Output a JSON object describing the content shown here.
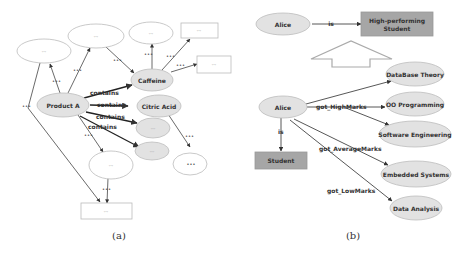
{
  "figure_a": {
    "caption": "(a)",
    "nodes": {
      "product": "Product A",
      "caffeine": "Caffeine",
      "citric": "Citric Acid",
      "grey1": "---",
      "grey2": "---",
      "top_left": "---",
      "top_mid": "---",
      "top_right": "---",
      "box_top": "---",
      "box_right": "---",
      "mid_white": "---",
      "right_small": "•••",
      "box_bottom": "---"
    },
    "edges": {
      "contains1": "contains",
      "contains2": "contains",
      "contains3": "contains",
      "contains4": "contains",
      "dots": "•••"
    }
  },
  "figure_b": {
    "caption": "(b)",
    "nodes": {
      "alice_top": "Alice",
      "high_line1": "High-performing",
      "high_line2": "Student",
      "alice": "Alice",
      "db": "DataBase Theory",
      "oo": "OO Programming",
      "se": "Software Engineering",
      "student": "Student",
      "emb": "Embedded Systems",
      "da": "Data Analysis"
    },
    "edges": {
      "is_top": "is",
      "is": "is",
      "high": "got_HighMarks",
      "avg": "got_AverageMarks",
      "low": "got_LowMarks"
    }
  },
  "colors": {
    "node_fill": "#e2e2e2",
    "box_fill": "#a6a6a6",
    "stroke": "#555555"
  }
}
